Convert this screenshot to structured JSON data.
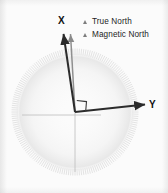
{
  "figure": {
    "background_color": "#fbfbfb"
  },
  "axes": {
    "x_label": "X",
    "y_label": "Y",
    "right_angle_marker": "right-angle"
  },
  "legend": {
    "items": [
      {
        "marker": "triangle-marker",
        "label": "True North",
        "color": "#2b2b2b"
      },
      {
        "marker": "triangle-marker",
        "label": "Magnetic North",
        "color": "#8a8a8a"
      }
    ]
  },
  "chart_data": {
    "type": "scatter",
    "xlabel": "X",
    "ylabel": "Y",
    "origin": {
      "x": 75,
      "y": 112
    },
    "dial": {
      "center_x": 75,
      "center_y": 112,
      "radius": 62,
      "tick_count": 180,
      "color": "#cfcfcf"
    },
    "series": [
      {
        "name": "True North",
        "type": "vector",
        "color": "#2b2b2b",
        "from": [
          75,
          112
        ],
        "to": [
          63,
          32
        ],
        "bearing_deg": 351.5
      },
      {
        "name": "Magnetic North",
        "type": "vector",
        "color": "#8a8a8a",
        "from": [
          75,
          112
        ],
        "to": [
          70,
          32
        ],
        "bearing_deg": 356.4
      },
      {
        "name": "X axis",
        "type": "vector",
        "color": "#2b2b2b",
        "from": [
          75,
          112
        ],
        "to": [
          63,
          32
        ]
      },
      {
        "name": "Y axis",
        "type": "vector",
        "color": "#2b2b2b",
        "from": [
          75,
          112
        ],
        "to": [
          147,
          104
        ]
      }
    ],
    "guides": [
      {
        "name": "horizontal-guide",
        "from": [
          22,
          115
        ],
        "to": [
          100,
          115
        ],
        "color": "#b9b9b9"
      },
      {
        "name": "vertical-guide",
        "from": [
          75,
          112
        ],
        "to": [
          75,
          172
        ],
        "color": "#b9b9b9"
      }
    ],
    "grid": false,
    "legend_position": "top-right"
  }
}
